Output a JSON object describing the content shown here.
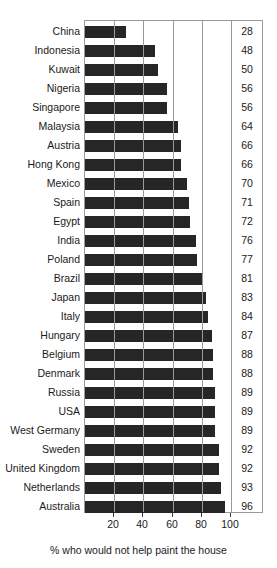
{
  "chart_data": {
    "type": "bar",
    "orientation": "horizontal",
    "title": "",
    "subtitle": "",
    "xlabel": "% who would not help paint the house",
    "ylabel": "",
    "xlim": [
      0,
      100
    ],
    "xticks": [
      20,
      40,
      60,
      80,
      100
    ],
    "xtick_labels": [
      "20",
      "40",
      "60",
      "80",
      "100"
    ],
    "grid": "vertical gridlines at 20, 40, 60, 80; frame border; value column at right separated by vertical rule",
    "legend": null,
    "legend_position": "none",
    "bar_color": "#262626",
    "categories": [
      "China",
      "Indonesia",
      "Kuwait",
      "Nigeria",
      "Singapore",
      "Malaysia",
      "Austria",
      "Hong Kong",
      "Mexico",
      "Spain",
      "Egypt",
      "India",
      "Poland",
      "Brazil",
      "Japan",
      "Italy",
      "Hungary",
      "Belgium",
      "Denmark",
      "Russia",
      "USA",
      "West Germany",
      "Sweden",
      "United Kingdom",
      "Netherlands",
      "Australia"
    ],
    "values": [
      28,
      48,
      50,
      56,
      56,
      64,
      66,
      66,
      70,
      71,
      72,
      76,
      77,
      81,
      83,
      84,
      87,
      88,
      88,
      89,
      89,
      89,
      92,
      92,
      93,
      96
    ],
    "value_labels": [
      "28",
      "48",
      "50",
      "56",
      "56",
      "64",
      "66",
      "66",
      "70",
      "71",
      "72",
      "76",
      "77",
      "81",
      "83",
      "84",
      "87",
      "88",
      "88",
      "89",
      "89",
      "89",
      "92",
      "92",
      "93",
      "96"
    ]
  },
  "colors": {
    "bar": "#262626",
    "frame": "#9a9a9a",
    "text": "#1a1a1a",
    "background": "#ffffff"
  }
}
